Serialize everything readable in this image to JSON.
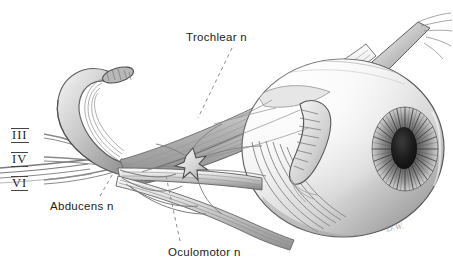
{
  "figure": {
    "medium": "grayscale pencil anatomical illustration",
    "background_color": "#ffffff",
    "ink_color": "#3a3a3a",
    "signature": "D.W."
  },
  "roman_numerals": [
    {
      "id": "iii",
      "text": "III",
      "x": 11,
      "y": 128
    },
    {
      "id": "iv",
      "text": "IV",
      "x": 11,
      "y": 152
    },
    {
      "id": "vi",
      "text": "VI",
      "x": 11,
      "y": 176
    }
  ],
  "labels": [
    {
      "id": "trochlear",
      "text": "Trochlear n",
      "x": 186,
      "y": 31
    },
    {
      "id": "abducens",
      "text": "Abducens n",
      "x": 50,
      "y": 200
    },
    {
      "id": "oculomotor",
      "text": "Oculomotor n",
      "x": 168,
      "y": 246
    }
  ],
  "leader_lines": [
    {
      "id": "trochlear-leader",
      "from": [
        232,
        48
      ],
      "to": [
        198,
        118
      ],
      "style": "dashed"
    },
    {
      "id": "abducens-leader",
      "from": [
        100,
        196
      ],
      "to": [
        122,
        158
      ],
      "style": "dashed"
    },
    {
      "id": "oculomotor-leader",
      "from": [
        180,
        241
      ],
      "to": [
        166,
        176
      ],
      "style": "dashed"
    }
  ],
  "structures": [
    {
      "id": "eyeball",
      "name": "eyeball / globe"
    },
    {
      "id": "iris",
      "name": "iris with radial striations"
    },
    {
      "id": "pupil",
      "name": "pupil"
    },
    {
      "id": "trochlea",
      "name": "trochlea (superior oblique pulley)"
    },
    {
      "id": "superior-oblique",
      "name": "superior oblique muscle and tendon"
    },
    {
      "id": "ciliary-ganglion",
      "name": "ciliary ganglion"
    },
    {
      "id": "short-ciliary",
      "name": "short ciliary nerves"
    },
    {
      "id": "lateral-rectus",
      "name": "lateral rectus muscle"
    },
    {
      "id": "inferior-rectus",
      "name": "inferior rectus muscle"
    },
    {
      "id": "superior-rectus",
      "name": "superior rectus muscle"
    },
    {
      "id": "inferior-oblique",
      "name": "inferior oblique muscle"
    },
    {
      "id": "optic-nerve",
      "name": "optic nerve / orbital apex"
    }
  ]
}
